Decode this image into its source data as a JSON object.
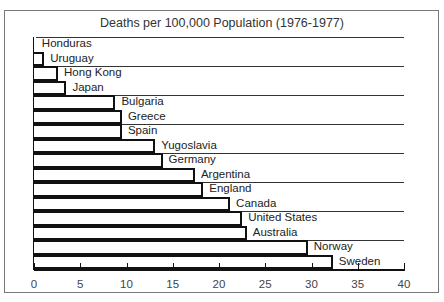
{
  "chart_data": {
    "type": "bar",
    "orientation": "horizontal",
    "title": "Deaths per 100,000 Population (1976-1977)",
    "xlabel": "",
    "ylabel": "",
    "xlim": [
      0,
      40
    ],
    "xticks": [
      0,
      5,
      10,
      15,
      20,
      25,
      30,
      35,
      40
    ],
    "categories": [
      "Honduras",
      "Uruguay",
      "Hong Kong",
      "Japan",
      "Bulgaria",
      "Greece",
      "Spain",
      "Yugoslavia",
      "Germany",
      "Argentina",
      "England",
      "Canada",
      "United States",
      "Australia",
      "Norway",
      "Sweden"
    ],
    "values": [
      0.2,
      1.1,
      2.6,
      3.5,
      8.8,
      9.5,
      9.5,
      13.1,
      13.9,
      17.4,
      18.3,
      21.2,
      22.5,
      23.0,
      29.6,
      32.3
    ],
    "grid": false,
    "legend": null
  },
  "colors": {
    "bar_fill": "#ffffff",
    "bar_border": "#111111",
    "frame": "#777777"
  }
}
